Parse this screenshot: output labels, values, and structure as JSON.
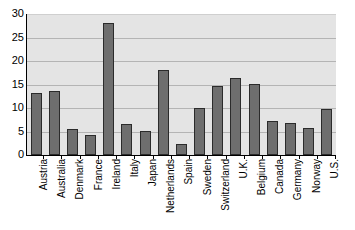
{
  "chart_data": {
    "type": "bar",
    "title": "",
    "subtitle": "",
    "xlabel": "",
    "ylabel": "",
    "ylim": [
      0,
      30
    ],
    "yticks": [
      0,
      5,
      10,
      15,
      20,
      25,
      30
    ],
    "grid": true,
    "legend": "none",
    "bar_color": "#6e6e6e",
    "bar_edge_color": "#2b2b2b",
    "plot_background": "#e4e4e4",
    "gridline_color": "#b4b4b4",
    "categories": [
      "Austria",
      "Australia",
      "Denmark",
      "France",
      "Ireland",
      "Italy",
      "Japan",
      "Netherlands",
      "Spain",
      "Sweden",
      "Switzerland",
      "U.K.",
      "Belgium",
      "Canada",
      "Germany",
      "Norway",
      "U.S."
    ],
    "values": [
      13.2,
      13.7,
      5.6,
      4.2,
      28.0,
      6.6,
      5.1,
      18.0,
      2.4,
      10.0,
      14.6,
      16.4,
      15.1,
      7.3,
      6.8,
      5.7,
      9.7
    ]
  }
}
